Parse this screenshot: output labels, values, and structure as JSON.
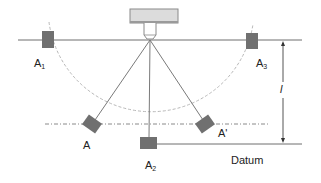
{
  "diagram": {
    "type": "measurement-geometry",
    "colors": {
      "line": "#6e6e6e",
      "block": "#707070",
      "camera_fill": "#dcdcdc",
      "camera_stroke": "#8a8a8a",
      "arc": "#b8b8b8",
      "text": "#222222"
    },
    "labels": {
      "a1": {
        "base": "A",
        "sub": "1"
      },
      "a2": {
        "base": "A",
        "sub": "2"
      },
      "a3": {
        "base": "A",
        "sub": "3"
      },
      "a": "A",
      "a_prime": "A'",
      "length": "l",
      "datum": "Datum"
    }
  }
}
